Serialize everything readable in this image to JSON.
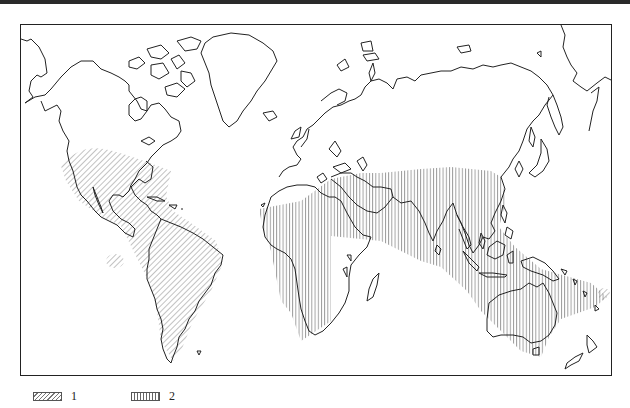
{
  "map": {
    "type": "world outline map with hatched distribution zones",
    "projection": "Miller-like cylindrical",
    "colors": {
      "outline": "#222222",
      "hatch": "#666666",
      "background": "#ffffff",
      "top_band": "#2a2a2a"
    },
    "regions": [
      {
        "id": "zone-1-americas",
        "pattern": "diagonal",
        "legend_key": "1",
        "area": "Southern USA, Mexico, Central America, Caribbean, South America"
      },
      {
        "id": "zone-1-hawaii",
        "pattern": "diagonal",
        "legend_key": "1",
        "area": "Hawaii (Pacific)"
      },
      {
        "id": "zone-1-fiji",
        "pattern": "diagonal",
        "legend_key": "1",
        "area": "Fiji (SW Pacific)"
      },
      {
        "id": "zone-2-old-world",
        "pattern": "vertical",
        "legend_key": "2",
        "area": "Africa, Southern Europe edge, Middle East, South & Southeast Asia, China, Indonesia, New Guinea, Australia, Melanesia"
      }
    ]
  },
  "legend": {
    "items": [
      {
        "pattern": "diagonal",
        "label": "1"
      },
      {
        "pattern": "vertical",
        "label": "2"
      }
    ]
  }
}
